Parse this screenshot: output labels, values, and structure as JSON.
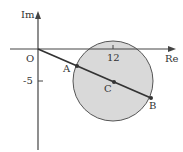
{
  "diagram": {
    "axes": {
      "x_label": "Re",
      "y_label": "Im",
      "origin_label": "O",
      "x_tick_label": "12",
      "y_tick_label": "-5"
    },
    "circle": {
      "center_label": "C",
      "center": [
        12,
        -5
      ],
      "fill": "#d9d9d9",
      "stroke": "#555555"
    },
    "points": [
      {
        "label": "A"
      },
      {
        "label": "B"
      },
      {
        "label": "C"
      }
    ],
    "line": {
      "from": "O",
      "through": [
        "A",
        "C"
      ],
      "to": "B",
      "color": "#333333"
    }
  }
}
